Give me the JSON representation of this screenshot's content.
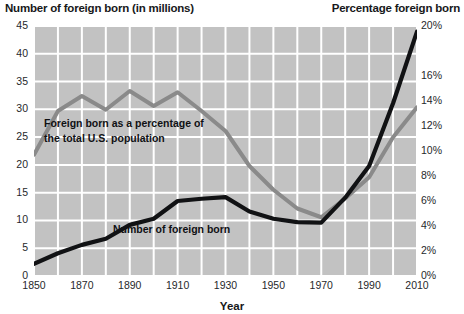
{
  "titles": {
    "left_axis_title": "Number of foreign born (in millions)",
    "right_axis_title": "Percentage foreign born",
    "x_axis_title": "Year"
  },
  "annotations": {
    "percentage_line_label_line1": "Foreign born as a percentage of",
    "percentage_line_label_line2": "the total U.S. population",
    "number_line_label": "Number of foreign born"
  },
  "colors": {
    "plot_background": "#c2c2c2",
    "gridline": "#ffffff",
    "number_line": "#111214",
    "percentage_line": "#8a8a8a",
    "text": "#17181a"
  },
  "chart_data": {
    "type": "line",
    "title": "",
    "xlabel": "Year",
    "grid": true,
    "legend": "annotated-inline",
    "x": [
      1850,
      1860,
      1870,
      1880,
      1890,
      1900,
      1910,
      1920,
      1930,
      1940,
      1950,
      1960,
      1970,
      1980,
      1990,
      2000,
      2010
    ],
    "xlim": [
      1850,
      2010
    ],
    "xticks": [
      "1850",
      "1870",
      "1890",
      "1910",
      "1930",
      "1950",
      "1970",
      "1990",
      "2010"
    ],
    "xtick_values": [
      1850,
      1870,
      1890,
      1910,
      1930,
      1950,
      1970,
      1990,
      2010
    ],
    "series": [
      {
        "name": "Number of foreign born",
        "axis": "left",
        "unit": "millions",
        "color": "#111214",
        "ylabel": "Number of foreign born (in millions)",
        "ylim": [
          0,
          45
        ],
        "yticks": [
          "0",
          "5",
          "10",
          "15",
          "20",
          "25",
          "30",
          "35",
          "40",
          "45"
        ],
        "ytick_values": [
          0,
          5,
          10,
          15,
          20,
          25,
          30,
          35,
          40,
          45
        ],
        "values": [
          2.2,
          4.1,
          5.6,
          6.7,
          9.2,
          10.3,
          13.5,
          13.9,
          14.2,
          11.6,
          10.3,
          9.7,
          9.6,
          14.1,
          19.8,
          31.1,
          44.0
        ]
      },
      {
        "name": "Foreign born as a percentage of the total U.S. population",
        "axis": "right",
        "unit": "percent",
        "color": "#8a8a8a",
        "ylabel": "Percentage foreign born",
        "ylim": [
          0,
          20
        ],
        "yticks": [
          "0%",
          "2%",
          "4%",
          "6%",
          "8%",
          "10%",
          "12%",
          "14%",
          "16%",
          "20%"
        ],
        "ytick_values": [
          0,
          2,
          4,
          6,
          8,
          10,
          12,
          14,
          16,
          20
        ],
        "values": [
          9.7,
          13.2,
          14.4,
          13.3,
          14.8,
          13.6,
          14.7,
          13.2,
          11.6,
          8.8,
          6.9,
          5.4,
          4.7,
          6.2,
          7.9,
          11.1,
          13.5
        ]
      }
    ]
  },
  "y_axis_left_ticks": [
    "45",
    "40",
    "35",
    "30",
    "25",
    "20",
    "15",
    "10",
    "5",
    "0"
  ],
  "y_axis_right_ticks": [
    "20%",
    "16%",
    "14%",
    "12%",
    "10%",
    "8%",
    "6%",
    "4%",
    "2%",
    "0%"
  ],
  "x_axis_ticks": [
    "1850",
    "1870",
    "1890",
    "1910",
    "1930",
    "1950",
    "1970",
    "1990",
    "2010"
  ]
}
